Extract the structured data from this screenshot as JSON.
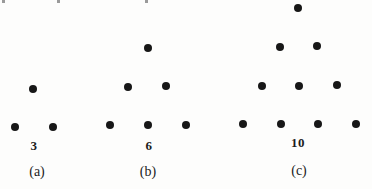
{
  "page": {
    "background": "#fdfdfc",
    "dot_color": "#171717",
    "dot_diameter_px": 8,
    "clipped_top_text_fragments": [
      {
        "x": 2
      },
      {
        "x": 57
      },
      {
        "x": 145
      }
    ]
  },
  "figures": [
    {
      "id": "a",
      "count": 3,
      "count_label": "3",
      "caption": "(a)",
      "rows": [
        1,
        2
      ],
      "dots": [
        {
          "x": 33,
          "y": 89
        },
        {
          "x": 15,
          "y": 127
        },
        {
          "x": 53,
          "y": 127
        }
      ],
      "count_label_pos": {
        "x": 34,
        "y": 146
      },
      "caption_pos": {
        "x": 37,
        "y": 172
      }
    },
    {
      "id": "b",
      "count": 6,
      "count_label": "6",
      "caption": "(b)",
      "rows": [
        1,
        2,
        3
      ],
      "dots": [
        {
          "x": 148,
          "y": 48
        },
        {
          "x": 128,
          "y": 87
        },
        {
          "x": 166,
          "y": 86
        },
        {
          "x": 110,
          "y": 125
        },
        {
          "x": 148,
          "y": 125
        },
        {
          "x": 186,
          "y": 125
        }
      ],
      "count_label_pos": {
        "x": 149,
        "y": 146
      },
      "caption_pos": {
        "x": 148,
        "y": 172
      }
    },
    {
      "id": "c",
      "count": 10,
      "count_label": "10",
      "caption": "(c)",
      "rows": [
        1,
        2,
        3,
        4
      ],
      "dots": [
        {
          "x": 298,
          "y": 8
        },
        {
          "x": 280,
          "y": 47
        },
        {
          "x": 317,
          "y": 46
        },
        {
          "x": 262,
          "y": 86
        },
        {
          "x": 299,
          "y": 86
        },
        {
          "x": 337,
          "y": 85
        },
        {
          "x": 243,
          "y": 124
        },
        {
          "x": 281,
          "y": 124
        },
        {
          "x": 318,
          "y": 124
        },
        {
          "x": 356,
          "y": 124
        }
      ],
      "count_label_pos": {
        "x": 298,
        "y": 143
      },
      "caption_pos": {
        "x": 299,
        "y": 171
      }
    }
  ]
}
